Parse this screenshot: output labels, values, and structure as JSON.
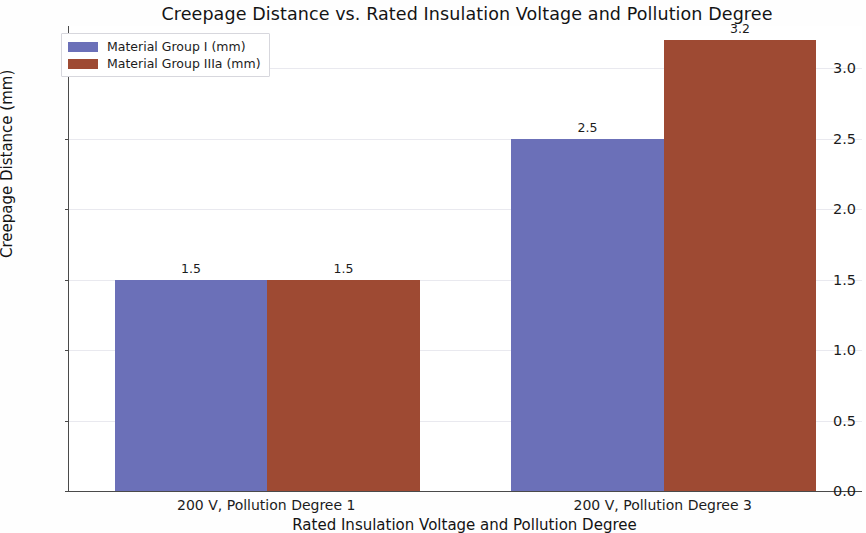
{
  "chart_data": {
    "type": "bar",
    "title": "Creepage Distance vs. Rated Insulation Voltage and Pollution Degree",
    "xlabel": "Rated Insulation Voltage and Pollution Degree",
    "ylabel": "Creepage Distance (mm)",
    "categories": [
      "200 V, Pollution Degree 1",
      "200 V, Pollution Degree 3"
    ],
    "series": [
      {
        "name": "Material Group I (mm)",
        "color": "#6b70b8",
        "values": [
          1.5,
          2.5
        ],
        "labels": [
          "1.5",
          "2.5"
        ]
      },
      {
        "name": "Material Group IIIa (mm)",
        "color": "#9e4a33",
        "values": [
          1.5,
          3.2
        ],
        "labels": [
          "1.5",
          "3.2"
        ]
      }
    ],
    "ylim": [
      0.0,
      3.3
    ],
    "yticks": [
      0.0,
      0.5,
      1.0,
      1.5,
      2.0,
      2.5,
      3.0
    ],
    "ytick_labels": [
      "0.0",
      "0.5",
      "1.0",
      "1.5",
      "2.0",
      "2.5",
      "3.0"
    ],
    "grid": true,
    "grid_axis": "y",
    "legend_position": "upper left",
    "background_color": "#ffffff"
  }
}
